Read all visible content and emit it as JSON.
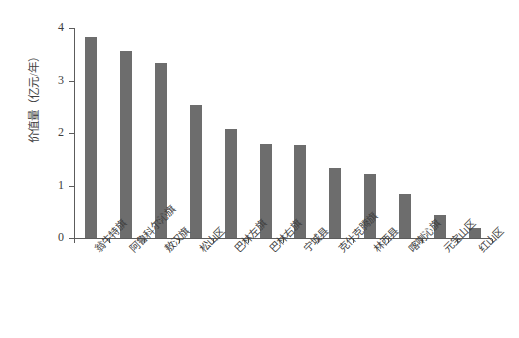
{
  "chart_data": {
    "type": "bar",
    "title": "",
    "xlabel": "",
    "ylabel": "价值量（亿元/年）",
    "ylim": [
      0,
      4
    ],
    "yticks": [
      "0",
      "1",
      "2",
      "3",
      "4"
    ],
    "grid": false,
    "legend": null,
    "bar_color": "#6d6d6d",
    "axis_color": "#5c5c5c",
    "categories": [
      "翁牛特旗",
      "阿鲁科尔沁旗",
      "敖汉旗",
      "松山区",
      "巴林左旗",
      "巴林右旗",
      "宁城县",
      "克什克腾旗",
      "林西县",
      "喀喇沁旗",
      "元宝山区",
      "红山区"
    ],
    "values": [
      3.83,
      3.57,
      3.33,
      2.53,
      2.07,
      1.8,
      1.77,
      1.34,
      1.22,
      0.84,
      0.44,
      0.2
    ]
  }
}
